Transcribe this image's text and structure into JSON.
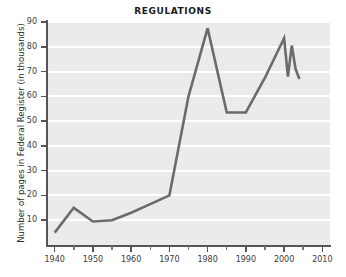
{
  "chart_data": {
    "type": "line",
    "title": "REGULATIONS",
    "xlabel": "",
    "ylabel": "Number of pages in Federal Register (in thousands)",
    "xlim": [
      1938,
      2012
    ],
    "ylim": [
      0,
      90
    ],
    "grid": true,
    "legend": false,
    "y_ticks": [
      10,
      20,
      30,
      40,
      50,
      60,
      70,
      80,
      90
    ],
    "x_ticks": [
      1940,
      1950,
      1960,
      1970,
      1980,
      1990,
      2000,
      2010
    ],
    "x_minor_ticks": [
      1945,
      1955,
      1965,
      1975,
      1985,
      1995,
      2005
    ],
    "series": [
      {
        "name": "Pages in Federal Register",
        "color": "#6b6b6b",
        "x": [
          1940,
          1945,
          1950,
          1955,
          1960,
          1965,
          1970,
          1975,
          1980,
          1985,
          1990,
          1995,
          2000,
          2001,
          2002,
          2003,
          2004
        ],
        "values": [
          5,
          15,
          9.5,
          10,
          13,
          16.5,
          20,
          60,
          87.5,
          53.5,
          53.5,
          67.5,
          83.5,
          68,
          80.5,
          71,
          67
        ]
      }
    ]
  }
}
